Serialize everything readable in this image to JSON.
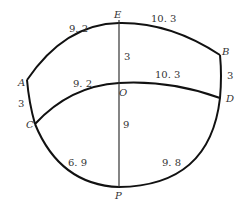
{
  "diagram": {
    "type": "curved-pattern-sketch",
    "points": {
      "A": "A",
      "B": "B",
      "C": "C",
      "D": "D",
      "E": "E",
      "O": "O",
      "P": "P"
    },
    "measurements": {
      "AE": "9. 2",
      "EB": "10. 3",
      "EO": "3",
      "BD": "3",
      "AC": "3",
      "CO": "9. 2",
      "OD": "10. 3",
      "OP": "9",
      "CP": "6. 9",
      "PD": "9. 8"
    },
    "colors": {
      "stroke": "#111111",
      "text": "#333333",
      "background": "#ffffff"
    }
  }
}
